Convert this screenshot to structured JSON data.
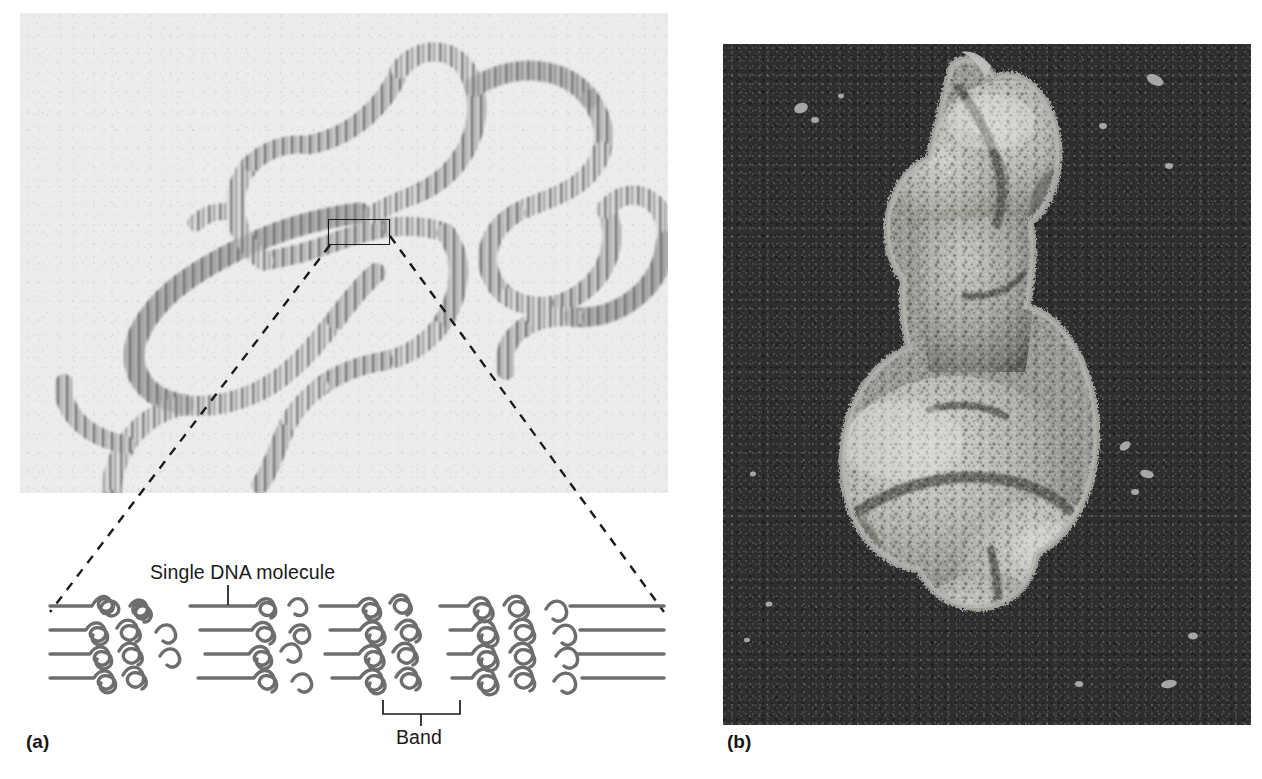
{
  "figure": {
    "panels": [
      {
        "id": "a",
        "letter": "(a)",
        "kind": "light-micrograph-plus-diagram",
        "description": "Light micrograph of a polytene chromosome with transverse bands, enlarged below as a diagram of parallel DNA molecules",
        "callout_labels": {
          "single_dna": "Single DNA molecule",
          "band": "Band"
        }
      },
      {
        "id": "b",
        "letter": "(b)",
        "kind": "scanning-electron-micrograph",
        "description": "Scanning electron micrograph of a condensed chromosome"
      }
    ]
  },
  "colors": {
    "page_background": "#ffffff",
    "micrograph_background": "#ececeb",
    "micrograph_band": "#4a4a4a",
    "sem_background": "#2e2e2e",
    "sem_highlight": "#c9c9c4",
    "ink": "#1a1a1a",
    "dna_strand": "#6a6a6a"
  },
  "diagram": {
    "strand_count": 4,
    "region_sequence": [
      "band",
      "interband",
      "band",
      "interband",
      "band",
      "interband",
      "band"
    ],
    "band_label_target": "third condensed region from left"
  }
}
